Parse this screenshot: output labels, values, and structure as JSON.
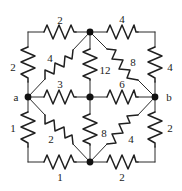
{
  "figure": {
    "type": "resistor-network-diagram",
    "stroke_color": "#2b2b2b",
    "label_color": "#1a1a1a",
    "background": "#ffffff"
  },
  "terminals": [
    {
      "id": "a",
      "label": "a",
      "x": 16,
      "y": 97
    },
    {
      "id": "b",
      "label": "b",
      "x": 169,
      "y": 97
    }
  ],
  "nodes": [
    {
      "id": "tl",
      "x": 28,
      "y": 32,
      "dot": false
    },
    {
      "id": "tc",
      "x": 90,
      "y": 32,
      "dot": true
    },
    {
      "id": "tr",
      "x": 155,
      "y": 32,
      "dot": false
    },
    {
      "id": "ml",
      "x": 28,
      "y": 97,
      "dot": true
    },
    {
      "id": "mc",
      "x": 90,
      "y": 97,
      "dot": true
    },
    {
      "id": "mr",
      "x": 155,
      "y": 97,
      "dot": true
    },
    {
      "id": "bl",
      "x": 28,
      "y": 162,
      "dot": false
    },
    {
      "id": "bc",
      "x": 90,
      "y": 162,
      "dot": true
    },
    {
      "id": "br",
      "x": 155,
      "y": 162,
      "dot": false
    }
  ],
  "resistors": [
    {
      "id": "r-top-left",
      "value": "2",
      "from": "tl",
      "to": "tc",
      "orientation": "horizontal",
      "label_x": 60,
      "label_y": 20
    },
    {
      "id": "r-top-right",
      "value": "4",
      "from": "tc",
      "to": "tr",
      "orientation": "horizontal",
      "label_x": 122,
      "label_y": 19
    },
    {
      "id": "r-left-upper",
      "value": "2",
      "from": "tl",
      "to": "ml",
      "orientation": "vertical",
      "label_x": 13,
      "label_y": 67
    },
    {
      "id": "r-left-lower",
      "value": "1",
      "from": "ml",
      "to": "bl",
      "orientation": "vertical",
      "label_x": 13,
      "label_y": 128
    },
    {
      "id": "r-right-upper",
      "value": "4",
      "from": "tr",
      "to": "mr",
      "orientation": "vertical",
      "label_x": 170,
      "label_y": 67
    },
    {
      "id": "r-right-lower",
      "value": "2",
      "from": "mr",
      "to": "br",
      "orientation": "vertical",
      "label_x": 170,
      "label_y": 128
    },
    {
      "id": "r-bottom-left",
      "value": "1",
      "from": "bl",
      "to": "bc",
      "orientation": "horizontal",
      "label_x": 60,
      "label_y": 177
    },
    {
      "id": "r-bottom-right",
      "value": "2",
      "from": "bc",
      "to": "br",
      "orientation": "horizontal",
      "label_x": 122,
      "label_y": 177
    },
    {
      "id": "r-mid-left",
      "value": "3",
      "from": "ml",
      "to": "mc",
      "orientation": "horizontal",
      "label_x": 60,
      "label_y": 84
    },
    {
      "id": "r-mid-right",
      "value": "6",
      "from": "mc",
      "to": "mr",
      "orientation": "horizontal",
      "label_x": 122,
      "label_y": 84
    },
    {
      "id": "r-center-upper",
      "value": "12",
      "from": "tc",
      "to": "mc",
      "orientation": "vertical",
      "label_x": 105,
      "label_y": 70
    },
    {
      "id": "r-center-lower",
      "value": "8",
      "from": "mc",
      "to": "bc",
      "orientation": "vertical",
      "label_x": 104,
      "label_y": 133
    },
    {
      "id": "r-diag-tl",
      "value": "4",
      "from": "ml",
      "to": "tc",
      "orientation": "diagonal",
      "label_x": 50,
      "label_y": 58
    },
    {
      "id": "r-diag-tr",
      "value": "8",
      "from": "tc",
      "to": "mr",
      "orientation": "diagonal",
      "label_x": 133,
      "label_y": 62
    },
    {
      "id": "r-diag-bl",
      "value": "2",
      "from": "ml",
      "to": "bc",
      "orientation": "diagonal",
      "label_x": 51,
      "label_y": 139
    },
    {
      "id": "r-diag-br",
      "value": "4",
      "from": "bc",
      "to": "mr",
      "orientation": "diagonal",
      "label_x": 131,
      "label_y": 139
    }
  ]
}
